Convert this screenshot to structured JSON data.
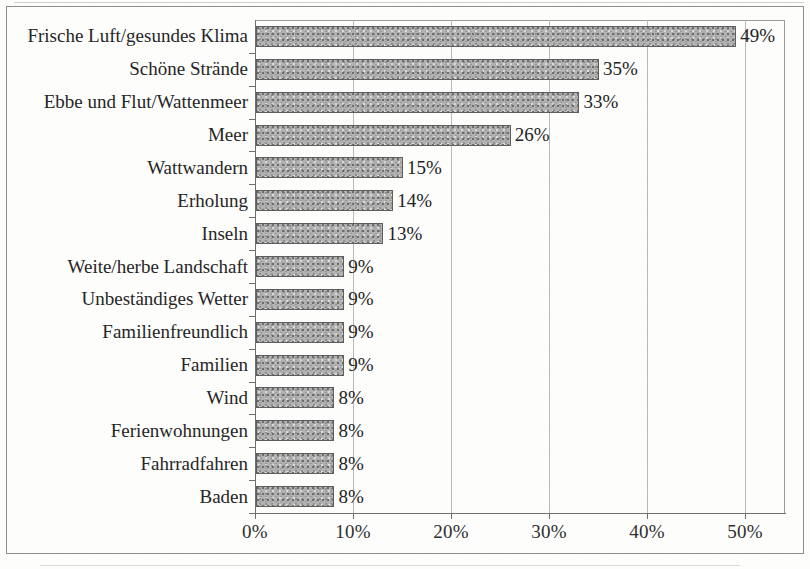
{
  "chart_data": {
    "type": "bar",
    "orientation": "horizontal",
    "title": "",
    "subtitle": "",
    "xlabel": "",
    "ylabel": "",
    "xlim": [
      0,
      54
    ],
    "axis_max_label": 50,
    "grid": true,
    "gridlines_x": [
      10,
      20,
      30,
      40,
      50
    ],
    "legend": null,
    "legend_position": "none",
    "tick_labels_x": [
      "0%",
      "10%",
      "20%",
      "30%",
      "40%",
      "50%"
    ],
    "tick_values_x": [
      0,
      10,
      20,
      30,
      40,
      50
    ],
    "value_label_suffix": "%",
    "bar_fill_color": "#b2b2b2",
    "bar_border_color": "#5e5e5e",
    "axis_color": "#6f6f6f",
    "gridline_color": "#b9b9b9",
    "categories": [
      "Frische Luft/gesundes Klima",
      "Schöne Strände",
      "Ebbe und Flut/Wattenmeer",
      "Meer",
      "Wattwandern",
      "Erholung",
      "Inseln",
      "Weite/herbe Landschaft",
      "Unbeständiges Wetter",
      "Familienfreundlich",
      "Familien",
      "Wind",
      "Ferienwohnungen",
      "Fahrradfahren",
      "Baden"
    ],
    "values": [
      49,
      35,
      33,
      26,
      15,
      14,
      13,
      9,
      9,
      9,
      9,
      8,
      8,
      8,
      8
    ],
    "value_labels": [
      "49%",
      "35%",
      "33%",
      "26%",
      "15%",
      "14%",
      "13%",
      "9%",
      "9%",
      "9%",
      "9%",
      "8%",
      "8%",
      "8%",
      "8%"
    ]
  }
}
